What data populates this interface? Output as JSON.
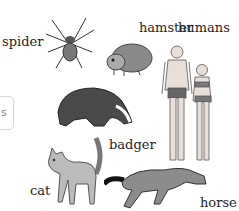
{
  "animals": [
    {
      "id": "spider",
      "label": "spider"
    },
    {
      "id": "hamster",
      "label": "hamster"
    },
    {
      "id": "humans",
      "label": "humans"
    },
    {
      "id": "badger",
      "label": "badger"
    },
    {
      "id": "cat",
      "label": "cat"
    },
    {
      "id": "horse",
      "label": "horse"
    }
  ],
  "side_card": {
    "text": "s"
  }
}
